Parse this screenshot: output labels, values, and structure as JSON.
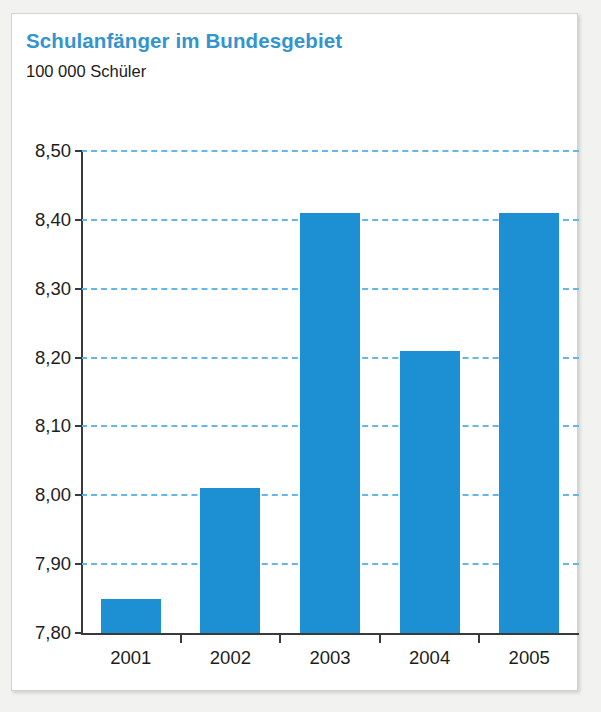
{
  "panel": {
    "background_color": "#ffffff",
    "border_color": "#d2d2d0"
  },
  "header": {
    "title": "Schulanfänger im Bundesgebiet",
    "title_color": "#3394ce",
    "subtitle": "100 000 Schüler",
    "subtitle_color": "#1b1b1b"
  },
  "chart_data": {
    "type": "bar",
    "title": "Schulanfänger im Bundesgebiet",
    "subtitle": "100 000 Schüler",
    "xlabel": "",
    "ylabel": "100 000 Schüler",
    "categories": [
      "2001",
      "2002",
      "2003",
      "2004",
      "2005"
    ],
    "values": [
      7.85,
      8.01,
      8.41,
      8.21,
      8.41
    ],
    "value_labels": [
      "7,85",
      "8,01",
      "8,41",
      "8,21",
      "8,41"
    ],
    "ylim": [
      7.8,
      8.5
    ],
    "ytick_values": [
      8.5,
      8.4,
      8.3,
      8.2,
      8.1,
      8.0,
      7.9,
      7.8
    ],
    "ytick_labels": [
      "8,50",
      "8,40",
      "8,30",
      "8,20",
      "8,10",
      "8,00",
      "7,90",
      "7,80"
    ],
    "grid": true,
    "grid_color": "#66b7e7",
    "grid_style": "dashed",
    "legend": false,
    "bar_color": "#1d90d4",
    "axis_color": "#3a3a3a",
    "decimal_separator": ","
  }
}
